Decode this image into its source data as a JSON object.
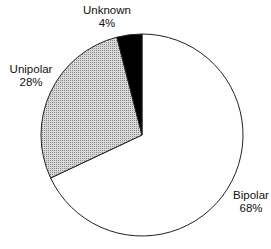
{
  "chart_data": {
    "type": "pie",
    "title": "",
    "start_angle_deg": 0,
    "direction": "clockwise",
    "slices": [
      {
        "label": "Bipolar",
        "value": 68,
        "display": "68%",
        "fill": "#ffffff",
        "pattern": "none",
        "label_pos": [
          251,
          199
        ]
      },
      {
        "label": "Unipolar",
        "value": 28,
        "display": "28%",
        "fill": "#c8c8c8",
        "pattern": "dots",
        "label_pos": [
          31,
          73
        ]
      },
      {
        "label": "Unknown",
        "value": 4,
        "display": "4%",
        "fill": "#000000",
        "pattern": "none",
        "label_pos": [
          107,
          14
        ]
      }
    ],
    "legend": "none",
    "labels": "outside, name and percent"
  }
}
